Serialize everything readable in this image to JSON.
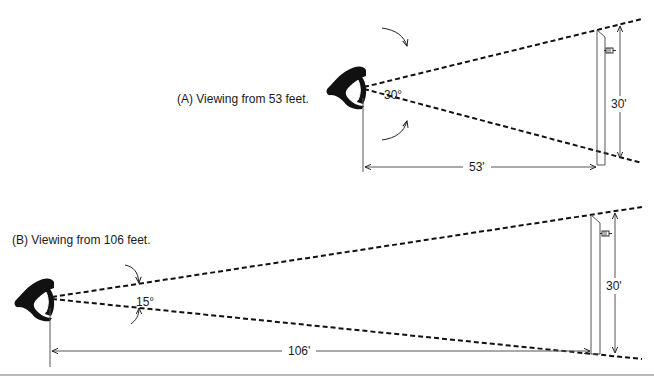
{
  "diagram": {
    "panel_a": {
      "caption": "(A) Viewing from 53 feet.",
      "angle_label": "30°",
      "distance_label": "53'",
      "screen_height_label": "30'"
    },
    "panel_b": {
      "caption": "(B) Viewing from 106 feet.",
      "angle_label": "15°",
      "distance_label": "106'",
      "screen_height_label": "30'"
    },
    "colors": {
      "ink": "#111111",
      "thin_line": "#555555",
      "background": "#ffffff"
    },
    "icons": [
      "viewer-head-icon",
      "speaker-icon"
    ]
  }
}
